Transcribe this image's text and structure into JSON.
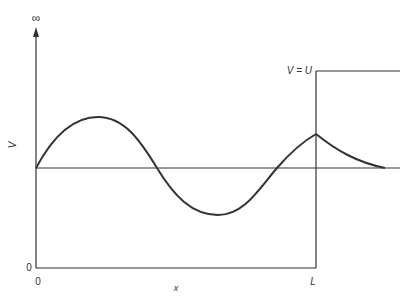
{
  "diagram": {
    "title": "",
    "labels": {
      "y_axis_top": "∞",
      "y_axis": "V",
      "y_origin": "0",
      "x_origin": "0",
      "x_end": "L",
      "x_axis": "x",
      "barrier": "V = U"
    },
    "elements": [
      "y-axis arrow from 0 up to ∞",
      "x-axis from 0 to L",
      "horizontal reference line (V = energy level)",
      "vertical barrier wall at x = L",
      "barrier top at V = U for x > L",
      "oscillating wavefunction for 0 < x < L",
      "exponentially decaying tail for x > L"
    ],
    "colors": {
      "line": "#333333",
      "background": "#ffffff"
    }
  }
}
